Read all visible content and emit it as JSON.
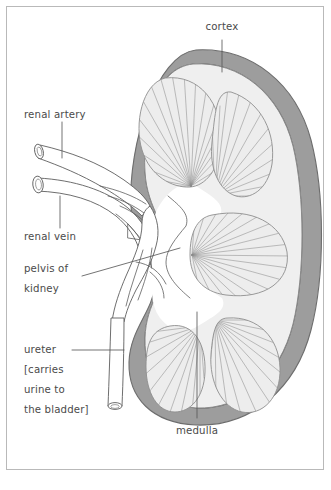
{
  "figure": {
    "background_color": "#ffffff",
    "frame_color": "#b9b9b9",
    "width": 331,
    "height": 490
  },
  "palette": {
    "cortex_fill": "#9d9d9d",
    "cortex_stroke": "#6d6d6d",
    "medulla_fill": "#efefef",
    "pyramid_fill": "#ededed",
    "striation_stroke": "#8d8d8d",
    "cavity_fill": "#ffffff",
    "outline_stroke": "#5e5e5e",
    "label_color": "#4a4a4a",
    "leader_color": "#5a5a5a"
  },
  "labels": {
    "cortex": "cortex",
    "renal_artery": "renal artery",
    "renal_vein": "renal vein",
    "pelvis_line1": "pelvis of",
    "pelvis_line2": "kidney",
    "ureter_line1": "ureter",
    "ureter_line2": "[carries",
    "ureter_line3": "urine to",
    "ureter_line4": "the bladder]",
    "medulla": "medulla"
  },
  "structures": {
    "cortex": "outer gray band of kidney",
    "medulla": "inner pale region containing renal pyramids",
    "pelvis": "central white cavity funnelling into the ureter",
    "renal_artery": "upper tube entering the hilum",
    "renal_vein": "lower tube entering the hilum",
    "ureter": "vertical tube descending from the renal pelvis"
  }
}
